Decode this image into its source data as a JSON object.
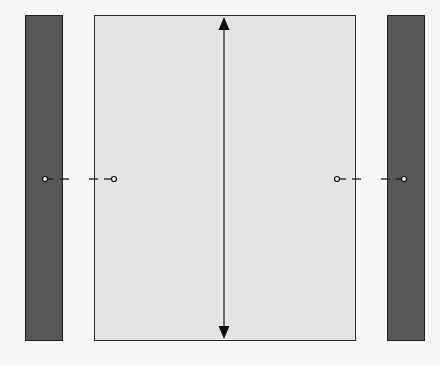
{
  "diagram": {
    "type": "layout-schematic",
    "colors": {
      "background": "#f7f7f7",
      "side_bar_fill": "#575757",
      "side_bar_border": "#1f1f1f",
      "panel_fill": "#e4e4e4",
      "panel_border": "#2a2a2a",
      "line": "#1a1a1a"
    },
    "elements": {
      "left_bar": {
        "x": 25,
        "y": 15,
        "width": 38,
        "height": 326
      },
      "center_panel": {
        "x": 94,
        "y": 15,
        "width": 262,
        "height": 326
      },
      "right_bar": {
        "x": 387,
        "y": 15,
        "width": 38,
        "height": 326
      },
      "vertical_dimension_arrow": {
        "x": 224,
        "y1": 17,
        "y2": 339,
        "style": "double-headed"
      },
      "left_connector": {
        "from_x": 45,
        "to_x": 114,
        "y": 179,
        "style": "dashed with circle ends"
      },
      "right_connector": {
        "from_x": 337,
        "to_x": 404,
        "y": 179,
        "style": "dashed with circle ends"
      }
    }
  }
}
